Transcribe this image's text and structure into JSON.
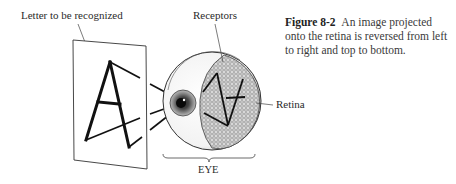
{
  "figure": {
    "labels": {
      "letter": "Letter to be recognized",
      "receptors": "Receptors",
      "retina": "Retina",
      "eye": "EYE"
    },
    "caption": {
      "number": "Figure 8-2",
      "text": "An image projected onto the retina is reversed from left to right and top to bottom."
    },
    "letter_shown": "A",
    "colors": {
      "ink": "#1a1a1a",
      "retina_fill": "#9a9a9a",
      "background": "#ffffff"
    }
  }
}
